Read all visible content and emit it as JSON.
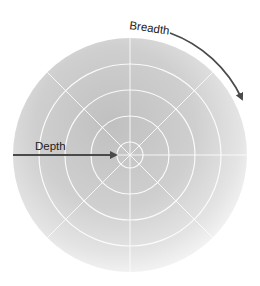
{
  "diagram": {
    "labels": {
      "depth": "Depth",
      "breadth": "Breadth"
    },
    "center": [
      130,
      155
    ],
    "outer_radius": 117,
    "ring_radii": [
      13,
      39,
      65,
      91
    ],
    "spoke_angles_deg": [
      0,
      45,
      90,
      135
    ],
    "colors": {
      "disk_inner": "#c2c2c2",
      "disk_mid": "#d2d2d2",
      "disk_outer": "#f4f4f4",
      "grid_lines": "#ffffff",
      "arrows": "#4a4a4a",
      "text": "#222222"
    }
  }
}
